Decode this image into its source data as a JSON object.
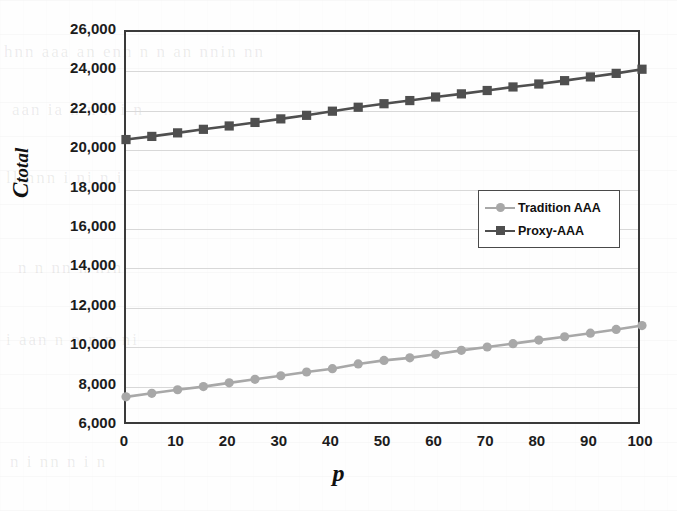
{
  "chart_data": {
    "type": "line",
    "title": "",
    "xlabel": "p",
    "ylabel": "C total",
    "ylabel_main": "C",
    "ylabel_sub": "total",
    "xlim": [
      0,
      100
    ],
    "ylim": [
      6000,
      26000
    ],
    "ytick_step": 2000,
    "xtick_step": 10,
    "grid": true,
    "grid_axis": "y",
    "legend_position": "middle-right-inside",
    "x": [
      0,
      5,
      10,
      15,
      20,
      25,
      30,
      35,
      40,
      45,
      50,
      55,
      60,
      65,
      70,
      75,
      80,
      85,
      90,
      95,
      100
    ],
    "xticks": [
      "0",
      "10",
      "20",
      "30",
      "40",
      "50",
      "60",
      "70",
      "80",
      "90",
      "100"
    ],
    "xtick_values": [
      0,
      10,
      20,
      30,
      40,
      50,
      60,
      70,
      80,
      90,
      100
    ],
    "yticks": [
      "6,000",
      "8,000",
      "10,000",
      "12,000",
      "14,000",
      "16,000",
      "18,000",
      "20,000",
      "22,000",
      "24,000",
      "26,000"
    ],
    "ytick_values": [
      6000,
      8000,
      10000,
      12000,
      14000,
      16000,
      18000,
      20000,
      22000,
      24000,
      26000
    ],
    "series": [
      {
        "name": "Tradition AAA",
        "color": "#a8a8a8",
        "marker": "circle",
        "values": [
          7480,
          7660,
          7840,
          8000,
          8190,
          8370,
          8550,
          8740,
          8910,
          9150,
          9330,
          9460,
          9640,
          9840,
          10010,
          10180,
          10360,
          10530,
          10710,
          10900,
          11100
        ]
      },
      {
        "name": "Proxy-AAA",
        "color": "#4f4f4f",
        "marker": "square",
        "values": [
          20540,
          20700,
          20880,
          21060,
          21230,
          21410,
          21590,
          21770,
          21980,
          22180,
          22360,
          22520,
          22700,
          22860,
          23030,
          23210,
          23360,
          23530,
          23720,
          23900,
          24110
        ]
      }
    ]
  },
  "legend": {
    "items": [
      {
        "label": "Tradition AAA",
        "color": "#a8a8a8",
        "marker": "circle"
      },
      {
        "label": "Proxy-AAA",
        "color": "#4f4f4f",
        "marker": "square"
      }
    ]
  },
  "background_text": [
    "hnn  aaa an enn   n     n an    nnin  nn",
    "aan   ia   n    n     n   i    n",
    "ll   nnn   i     ni   n    i",
    "n  n   nn   n    nin",
    "i   aan   n  n      n   n     ni",
    "n   i    nn    n  i     n"
  ]
}
